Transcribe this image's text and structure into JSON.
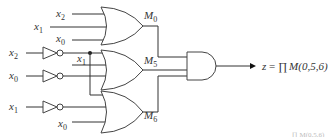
{
  "diagram": {
    "type": "logic-circuit",
    "inputs": {
      "m0": [
        {
          "var": "x",
          "sub": "2"
        },
        {
          "var": "x",
          "sub": "1"
        },
        {
          "var": "x",
          "sub": "0"
        }
      ],
      "inverters": [
        {
          "var": "x",
          "sub": "2"
        },
        {
          "var": "x",
          "sub": "0"
        },
        {
          "var": "x",
          "sub": "1"
        }
      ],
      "m5_direct": {
        "var": "x",
        "sub": "1"
      },
      "m6_direct": {
        "var": "x",
        "sub": "0"
      }
    },
    "gates": [
      {
        "id": "M0",
        "type": "OR",
        "label": "M",
        "sub": "0"
      },
      {
        "id": "M5",
        "type": "OR",
        "label": "M",
        "sub": "5"
      },
      {
        "id": "M6",
        "type": "OR",
        "label": "M",
        "sub": "6"
      },
      {
        "id": "AND",
        "type": "AND"
      }
    ],
    "output": {
      "lhs": "z",
      "eq": " = ",
      "prod": "∏",
      "rhs": "M(0,5,6)"
    },
    "fragment": "∏ M(0,5,6)"
  }
}
